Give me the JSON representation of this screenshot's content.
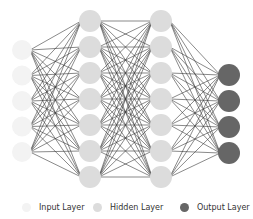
{
  "diagram": {
    "type": "neural-network",
    "layers": [
      {
        "name": "input",
        "label": "Input Layer",
        "nodes": 5,
        "x": 22,
        "y_start": 50,
        "spacing": 25.5,
        "radius": 10,
        "fill": "#f3f3f3"
      },
      {
        "name": "hidden1",
        "label": "Hidden Layer",
        "nodes": 7,
        "x": 90,
        "y_start": 21,
        "spacing": 26,
        "radius": 11,
        "fill": "#dcdcdc"
      },
      {
        "name": "hidden2",
        "label": "Hidden Layer",
        "nodes": 7,
        "x": 161,
        "y_start": 21,
        "spacing": 26,
        "radius": 11,
        "fill": "#dcdcdc"
      },
      {
        "name": "output",
        "label": "Output Layer",
        "nodes": 4,
        "x": 229,
        "y_start": 75,
        "spacing": 26,
        "radius": 11,
        "fill": "#666666"
      }
    ],
    "edge_color": "#3a3a3a",
    "edge_width": 0.6
  },
  "legend": {
    "items": [
      {
        "label": "Input Layer",
        "color": "#f3f3f3",
        "left": 22
      },
      {
        "label": "Hidden Layer",
        "color": "#dcdcdc",
        "left": 93
      },
      {
        "label": "Output Layer",
        "color": "#666666",
        "left": 180
      }
    ]
  }
}
